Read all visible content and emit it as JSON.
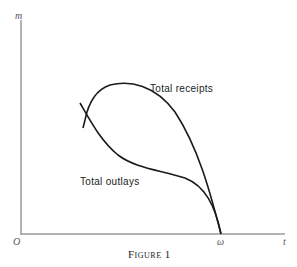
{
  "figure": {
    "caption": "Figure 1",
    "axes": {
      "y_label": "m",
      "x_label": "t",
      "origin_label": "O",
      "x_marker_label": "ω"
    },
    "curves": [
      {
        "name": "total-receipts",
        "label": "Total receipts"
      },
      {
        "name": "total-outlays",
        "label": "Total outlays"
      }
    ],
    "colors": {
      "axis": "#9a9a9a",
      "curve": "#1a1a1a",
      "text": "#222222"
    }
  }
}
